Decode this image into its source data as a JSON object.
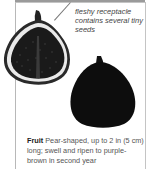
{
  "illustration": {
    "cut_fig_label": "cut-fig-cross-section",
    "whole_fig_label": "whole-ripe-fig"
  },
  "annotation": {
    "text": "fleshy receptacle contains several tiny seeds"
  },
  "description": {
    "term": "Fruit",
    "text": " Pear-shaped, up to 2 in (5 cm) long; swell and ripen to purple-brown in second year"
  },
  "colors": {
    "fig_dark": "#111111",
    "flesh_light": "#e8e8e8",
    "frame": "#bdbdbd"
  }
}
